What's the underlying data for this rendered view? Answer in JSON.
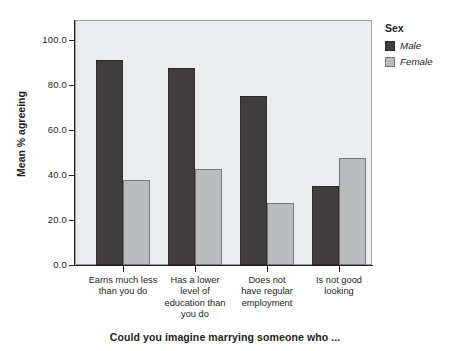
{
  "chart_data": {
    "type": "bar",
    "title": "",
    "xlabel": "Could you imagine marrying someone who ...",
    "ylabel": "Mean % agreeing",
    "ylim": [
      0.0,
      100.0
    ],
    "yticks": [
      "0.0",
      "20.0",
      "40.0",
      "60.0",
      "80.0",
      "100.0"
    ],
    "ytick_values": [
      0.0,
      20.0,
      40.0,
      60.0,
      80.0,
      100.0
    ],
    "grid": false,
    "legend_position": "right",
    "legend_title": "Sex",
    "categories": [
      "Earns much less than you do",
      "Has a lower level of education than you do",
      "Does not have regular employment",
      "Is not good looking"
    ],
    "category_lines": [
      [
        "Earns much less",
        "than you do"
      ],
      [
        "Has a lower",
        "level of",
        "education than",
        "you do"
      ],
      [
        "Does not",
        "have regular",
        "employment"
      ],
      [
        "Is not good",
        "looking"
      ]
    ],
    "series": [
      {
        "name": "Male",
        "color": "#3f3d3e",
        "values": [
          91.0,
          87.5,
          75.0,
          35.0
        ]
      },
      {
        "name": "Female",
        "color": "#b9bcbd",
        "values": [
          37.8,
          42.5,
          27.5,
          47.5
        ]
      }
    ]
  },
  "legend": {
    "title": "Sex",
    "items": [
      {
        "label": "Male",
        "color": "#3f3d3e"
      },
      {
        "label": "Female",
        "color": "#b9bcbd"
      }
    ]
  },
  "axes": {
    "y_title": "Mean % agreeing",
    "x_title": "Could you imagine marrying someone who ...",
    "y_ticks": [
      "100.0",
      "80.0",
      "60.0",
      "40.0",
      "20.0",
      "0.0"
    ]
  },
  "colors": {
    "plot_background": "#e9edee",
    "frame": "#9aa0a3",
    "male": "#3f3d3e",
    "female": "#b9bcbd",
    "text": "#231f20"
  }
}
